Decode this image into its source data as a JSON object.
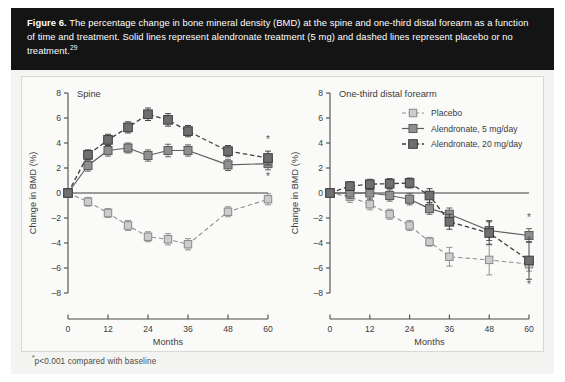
{
  "figure": {
    "label": "Figure 6.",
    "caption_text": " The percentage change in bone mineral density (BMD) at the spine and one-third distal forearm as a function of time and treatment. Solid lines represent alendronate treatment (5 mg) and dashed lines represent placebo or no treatment.",
    "caption_reference": "29",
    "footnote_symbol": "*",
    "footnote_text": "p<0.001 compared with baseline"
  },
  "colors": {
    "header_bg": "#141414",
    "header_text": "#ffffff",
    "board_bg": "#f4f4f2",
    "panel_bg": "#fafaf9",
    "axis": "#4a4a4a",
    "placebo": "#cccccc",
    "placebo_edge": "#8d8d8d",
    "alendronate5": "#8f8f8f",
    "alendronate5_edge": "#5d5d5d",
    "alendronate20": "#6f6f6f",
    "alendronate20_edge": "#3f3f3f"
  },
  "legend": {
    "position": "top-right of right panel",
    "entries": [
      {
        "label": "Placebo",
        "marker": "light-square-marker",
        "line": "dashed"
      },
      {
        "label": "Alendronate, 5 mg/day",
        "marker": "mid-gray-square-marker",
        "line": "solid"
      },
      {
        "label": "Alendronate, 20 mg/day",
        "marker": "dark-gray-square-marker",
        "line": "dashed"
      }
    ]
  },
  "chart_data": [
    {
      "type": "line",
      "title": "Spine",
      "xlabel": "Months",
      "ylabel": "Change in BMD (%)",
      "xlim": [
        0,
        60
      ],
      "ylim": [
        -8,
        8
      ],
      "xticks": [
        0,
        12,
        24,
        36,
        48,
        60
      ],
      "yticks": [
        -8,
        -6,
        -4,
        -2,
        0,
        2,
        4,
        6,
        8
      ],
      "grid": false,
      "zero_line": true,
      "series": [
        {
          "name": "Placebo",
          "style": "dashed",
          "marker": "light-square-marker",
          "x": [
            0,
            6,
            12,
            18,
            24,
            30,
            36,
            48,
            60
          ],
          "values": [
            0.0,
            -0.7,
            -1.6,
            -2.6,
            -3.5,
            -3.7,
            -4.1,
            -1.5,
            -0.5
          ],
          "errors": [
            0.0,
            0.35,
            0.35,
            0.4,
            0.4,
            0.45,
            0.45,
            0.4,
            0.45
          ]
        },
        {
          "name": "Alendronate, 5 mg/day",
          "style": "solid",
          "marker": "mid-gray-square-marker",
          "x": [
            0,
            6,
            12,
            18,
            24,
            30,
            36,
            48,
            60
          ],
          "values": [
            0.0,
            2.2,
            3.4,
            3.6,
            3.0,
            3.4,
            3.4,
            2.25,
            2.35
          ],
          "errors": [
            0.0,
            0.45,
            0.45,
            0.4,
            0.45,
            0.5,
            0.45,
            0.45,
            0.5
          ]
        },
        {
          "name": "Alendronate, 20 mg/day",
          "style": "dashed",
          "marker": "dark-gray-square-marker",
          "x": [
            0,
            6,
            12,
            18,
            24,
            30,
            36,
            48,
            60
          ],
          "values": [
            0.0,
            3.05,
            4.25,
            5.25,
            6.3,
            5.85,
            4.95,
            3.35,
            2.8
          ],
          "errors": [
            0.0,
            0.4,
            0.45,
            0.45,
            0.5,
            0.5,
            0.45,
            0.45,
            0.55
          ]
        }
      ],
      "annotations": [
        {
          "text": "*",
          "x": 60,
          "y": 4.0
        },
        {
          "text": "*",
          "x": 60,
          "y": 1.05
        }
      ]
    },
    {
      "type": "line",
      "title": "One-third distal forearm",
      "xlabel": "Months",
      "ylabel": "Change in BMD (%)",
      "xlim": [
        0,
        60
      ],
      "ylim": [
        -8,
        8
      ],
      "xticks": [
        0,
        12,
        24,
        36,
        48,
        60
      ],
      "yticks": [
        -8,
        -6,
        -4,
        -2,
        0,
        2,
        4,
        6,
        8
      ],
      "grid": false,
      "zero_line": true,
      "series": [
        {
          "name": "Placebo",
          "style": "dashed",
          "marker": "light-square-marker",
          "x": [
            0,
            6,
            12,
            18,
            24,
            30,
            36,
            48,
            60
          ],
          "values": [
            0.0,
            -0.3,
            -0.9,
            -1.7,
            -2.6,
            -3.9,
            -5.1,
            -5.35,
            -5.7
          ],
          "errors": [
            0.0,
            0.45,
            0.45,
            0.4,
            0.4,
            0.35,
            0.75,
            1.2,
            0.55
          ]
        },
        {
          "name": "Alendronate, 5 mg/day",
          "style": "solid",
          "marker": "mid-gray-square-marker",
          "x": [
            0,
            6,
            12,
            18,
            24,
            30,
            36,
            48,
            60
          ],
          "values": [
            0.0,
            0.0,
            0.0,
            -0.2,
            -0.5,
            -1.25,
            -1.7,
            -3.0,
            -3.4
          ],
          "errors": [
            0.0,
            0.45,
            0.5,
            0.45,
            0.45,
            0.45,
            0.5,
            0.8,
            0.55
          ]
        },
        {
          "name": "Alendronate, 20 mg/day",
          "style": "dashed",
          "marker": "dark-gray-square-marker",
          "x": [
            0,
            6,
            12,
            18,
            24,
            30,
            36,
            48,
            60
          ],
          "values": [
            0.0,
            0.55,
            0.7,
            0.75,
            0.8,
            -0.2,
            -2.3,
            -3.2,
            -5.4
          ],
          "errors": [
            0.0,
            0.35,
            0.4,
            0.4,
            0.4,
            0.55,
            0.6,
            0.9,
            1.5
          ]
        }
      ],
      "annotations": [
        {
          "text": "*",
          "x": 60,
          "y": -2.2
        },
        {
          "text": "*",
          "x": 60,
          "y": -4.1
        },
        {
          "text": "*",
          "x": 60,
          "y": -7.6
        }
      ]
    }
  ]
}
